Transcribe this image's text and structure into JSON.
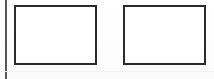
{
  "figure": {
    "kind": "scanned-figure",
    "background_color": "#ffffff",
    "canvas": {
      "width": 214,
      "height": 79
    }
  },
  "margin_rule": {
    "name": "left-margin-rule",
    "color": "#56565a",
    "thickness": 2
  },
  "scan_line": {
    "name": "bottom-scan-line",
    "color": "#f2f2f2",
    "thickness": 1
  },
  "frames": [
    {
      "id": "frame-1",
      "label": "",
      "content": "",
      "fill_color": "#ffffff",
      "border_color": "#2b2b2d",
      "border_width": 2,
      "x": 14,
      "y": 5,
      "width": 83,
      "height": 60
    },
    {
      "id": "frame-2",
      "label": "",
      "content": "",
      "fill_color": "#ffffff",
      "border_color": "#2b2b2d",
      "border_width": 2,
      "x": 123,
      "y": 5,
      "width": 83,
      "height": 60
    }
  ]
}
